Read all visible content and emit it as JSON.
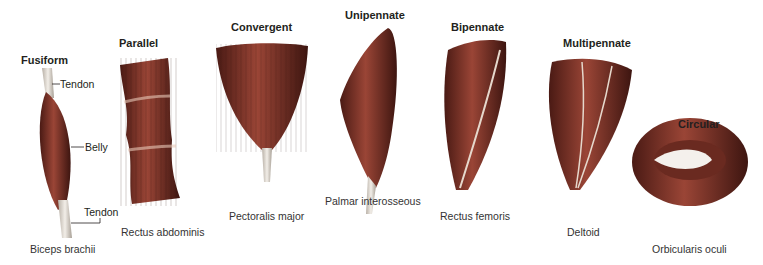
{
  "diagram": {
    "muscle_color": "#8b3a2e",
    "tendon_color": "#d9d4cc",
    "types": [
      {
        "title": "Fusiform",
        "example": "Biceps brachii"
      },
      {
        "title": "Parallel",
        "example": "Rectus abdominis"
      },
      {
        "title": "Convergent",
        "example": "Pectoralis major"
      },
      {
        "title": "Unipennate",
        "example": "Palmar interosseous"
      },
      {
        "title": "Bipennate",
        "example": "Rectus femoris"
      },
      {
        "title": "Multipennate",
        "example": "Deltoid"
      },
      {
        "title": "Circular",
        "example": "Orbicularis oculi"
      }
    ],
    "callouts": {
      "tendon_top": "Tendon",
      "belly": "Belly",
      "tendon_bottom": "Tendon"
    }
  }
}
